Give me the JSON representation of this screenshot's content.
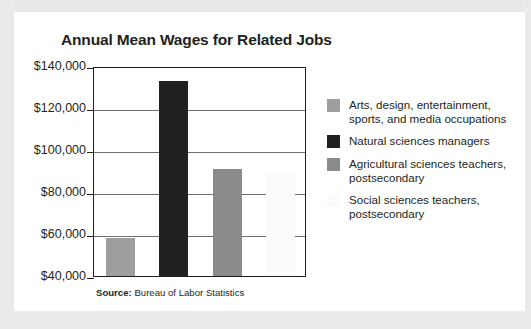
{
  "chart_data": {
    "type": "bar",
    "title": "Annual Mean Wages for Related Jobs",
    "xlabel": "",
    "ylabel": "",
    "ylim": [
      40000,
      140000
    ],
    "ytick_labels": [
      "$140,000",
      "$120,000",
      "$100,000",
      "$80,000",
      "$60,000",
      "$40,000"
    ],
    "ytick_values": [
      140000,
      120000,
      100000,
      80000,
      60000,
      40000
    ],
    "grid": true,
    "legend_position": "right",
    "categories": [
      "Arts, design, entertainment, sports, and media occupations",
      "Natural sciences managers",
      "Agricultural sciences teachers, postsecondary",
      "Social sciences teachers, postsecondary"
    ],
    "values": [
      58000,
      133000,
      91000,
      89000
    ],
    "colors": [
      "#9e9e9e",
      "#211f20",
      "#8b8b8b",
      "#fbfbfb"
    ],
    "series": [
      {
        "name": "Annual mean wage",
        "values": [
          58000,
          133000,
          91000,
          89000
        ]
      }
    ]
  },
  "chart": {
    "title": "Annual Mean Wages for Related Jobs",
    "source_label": "Source:",
    "source_text": "Bureau of Labor Statistics",
    "axis": {
      "ticks": [
        {
          "label": "$140,000",
          "value": 140000
        },
        {
          "label": "$120,000",
          "value": 120000
        },
        {
          "label": "$100,000",
          "value": 100000
        },
        {
          "label": "$80,000",
          "value": 80000
        },
        {
          "label": "$60,000",
          "value": 60000
        },
        {
          "label": "$40,000",
          "value": 40000
        }
      ]
    },
    "legend": [
      {
        "label": "Arts, design, entertainment,\nsports, and media occupations",
        "color": "#9e9e9e"
      },
      {
        "label": "Natural sciences managers",
        "color": "#211f20"
      },
      {
        "label": "Agricultural sciences teachers,\npostsecondary",
        "color": "#8b8b8b"
      },
      {
        "label": "Social sciences teachers,\npostsecondary",
        "color": "#fbfbfb"
      }
    ],
    "bars": [
      {
        "name": "arts-design-entertainment",
        "value": 58000,
        "color": "#9e9e9e"
      },
      {
        "name": "natural-sciences-managers",
        "value": 133000,
        "color": "#211f20"
      },
      {
        "name": "agricultural-sciences-teachers",
        "value": 91000,
        "color": "#8b8b8b"
      },
      {
        "name": "social-sciences-teachers",
        "value": 89000,
        "color": "#fbfbfb"
      }
    ]
  }
}
